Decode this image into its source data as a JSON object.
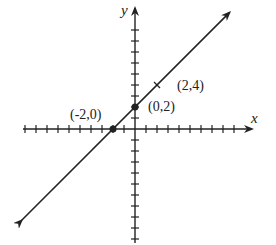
{
  "chart_data": {
    "type": "line",
    "title": "",
    "xlabel": "x",
    "ylabel": "y",
    "xlim": [
      -10,
      10
    ],
    "ylim": [
      -10,
      10
    ],
    "grid": false,
    "tick_step": 1,
    "tick_labels_shown": false,
    "series": [
      {
        "name": "y = x + 2",
        "slope": 1,
        "intercept": 2,
        "arrows_both_ends": true,
        "points": [
          {
            "x": -2,
            "y": 0,
            "label": "(-2,0)",
            "marker": "dot"
          },
          {
            "x": 0,
            "y": 2,
            "label": "(0,2)",
            "marker": "dot"
          },
          {
            "x": 2,
            "y": 4,
            "label": "(2,4)",
            "marker": "tick"
          }
        ]
      }
    ]
  },
  "labels": {
    "x_axis": "x",
    "y_axis": "y",
    "point_a": "(-2,0)",
    "point_b": "(0,2)",
    "point_c": "(2,4)"
  },
  "colors": {
    "ink": "#222222",
    "background": "#ffffff"
  }
}
